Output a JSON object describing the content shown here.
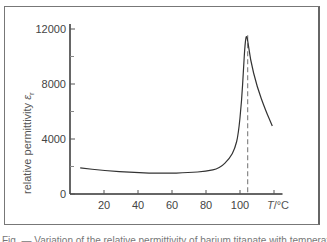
{
  "chart_data": {
    "type": "line",
    "title": "",
    "xlabel": "T/°C",
    "ylabel": "relative permittivity",
    "ylabel_symbol": "ε",
    "ylabel_subscript": "r",
    "xlim": [
      0,
      125
    ],
    "ylim": [
      0,
      12000
    ],
    "x_ticks": [
      20,
      40,
      60,
      80,
      100,
      120
    ],
    "x_tick_labels": [
      "20",
      "40",
      "60",
      "80",
      "100",
      ""
    ],
    "y_ticks": [
      0,
      4000,
      8000,
      12000
    ],
    "y_tick_labels": [
      "0",
      "4000",
      "8000",
      "12000"
    ],
    "y_minor_ticks": [
      2000,
      6000,
      10000
    ],
    "grid": false,
    "series": [
      {
        "name": "relative permittivity",
        "x": [
          6,
          20,
          38,
          55,
          70,
          80,
          88,
          94,
          97,
          99,
          101,
          102,
          103,
          104,
          106,
          110,
          115,
          119
        ],
        "y": [
          1900,
          1700,
          1550,
          1500,
          1550,
          1650,
          1850,
          2600,
          3300,
          4300,
          6800,
          9000,
          11000,
          11700,
          9800,
          7800,
          6100,
          4950
        ]
      }
    ],
    "annotations": [
      {
        "type": "vertical-dashed-line",
        "x": 104.5,
        "label": "Curie temperature"
      }
    ]
  },
  "caption": "Fig. — Variation of the relative permittivity of barium titanate with temperature"
}
